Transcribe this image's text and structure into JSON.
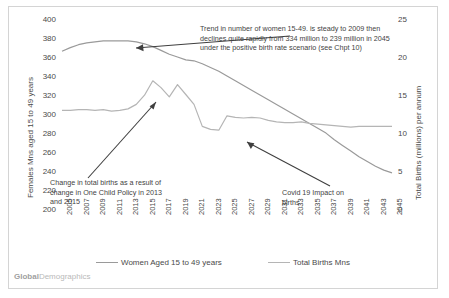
{
  "watermark": {
    "bold": "Global",
    "rest": "Demographics"
  },
  "axes": {
    "left_title": "Females Mns aged 15 to 49 years",
    "right_title": "Total Births (millions) per annum",
    "left_ticks": [
      "400",
      "380",
      "360",
      "340",
      "320",
      "300",
      "280",
      "260",
      "240",
      "220",
      "200"
    ],
    "right_ticks": [
      "25",
      "20",
      "15",
      "10",
      "5",
      "0"
    ],
    "x_ticks": [
      "2005",
      "2007",
      "2009",
      "2011",
      "2013",
      "2015",
      "2017",
      "2019",
      "2021",
      "2023",
      "2025",
      "2027",
      "2029",
      "2031",
      "2033",
      "2035",
      "2037",
      "2039",
      "2041",
      "2043",
      "2045"
    ]
  },
  "legend": [
    {
      "label": "Women Aged 15 to 49 years",
      "color": "#9a9a9a"
    },
    {
      "label": "Total Births Mns",
      "color": "#b5b5b5"
    }
  ],
  "annotations": [
    {
      "id": "women-trend",
      "text": "Trend in number of women 15-49. is steady to 2009 then declines quite rapidly from 334 million  to 239 million in 2045 under the positive birth rate scenario (see Chpt 10)"
    },
    {
      "id": "one-child-policy",
      "text": "Change in total births as a result of change in One Child Policy in 2013 and 2015"
    },
    {
      "id": "covid-impact",
      "text": "Covid 19 Impact on births"
    }
  ],
  "chart_data": {
    "type": "line",
    "title": "",
    "xlabel": "",
    "grid": false,
    "legend_position": "bottom",
    "x": [
      2005,
      2006,
      2007,
      2008,
      2009,
      2010,
      2011,
      2012,
      2013,
      2014,
      2015,
      2016,
      2017,
      2018,
      2019,
      2020,
      2021,
      2022,
      2023,
      2024,
      2025,
      2026,
      2027,
      2028,
      2029,
      2030,
      2031,
      2032,
      2033,
      2034,
      2035,
      2036,
      2037,
      2038,
      2039,
      2040,
      2041,
      2042,
      2043,
      2044,
      2045
    ],
    "series": [
      {
        "name": "Women Aged 15 to 49 years",
        "axis": "left",
        "ylabel": "Females Mns aged 15 to 49 years",
        "ylim": [
          200,
          400
        ],
        "color": "#9a9a9a",
        "values": [
          367,
          371,
          374,
          376,
          377,
          378,
          378,
          378,
          378,
          377,
          375,
          372,
          368,
          364,
          361,
          358,
          357,
          354,
          350,
          346,
          341,
          336,
          331,
          326,
          321,
          316,
          311,
          306,
          301,
          296,
          291,
          286,
          281,
          274,
          268,
          262,
          256,
          251,
          246,
          242,
          239
        ]
      },
      {
        "name": "Total Births Mns",
        "axis": "right",
        "ylabel": "Total Births (millions) per annum",
        "ylim": [
          0,
          25
        ],
        "color": "#b5b5b5",
        "values": [
          13.1,
          13.1,
          13.2,
          13.2,
          13.1,
          13.2,
          13.0,
          13.1,
          13.3,
          13.9,
          15.1,
          17.0,
          16.1,
          14.9,
          16.5,
          15.2,
          13.9,
          11.0,
          10.6,
          10.5,
          12.4,
          12.2,
          12.1,
          12.2,
          12.1,
          11.8,
          11.6,
          11.5,
          11.5,
          11.6,
          11.4,
          11.3,
          11.2,
          11.1,
          11.0,
          10.9,
          11.0,
          11.0,
          11.0,
          11.0,
          11.0
        ]
      }
    ]
  }
}
